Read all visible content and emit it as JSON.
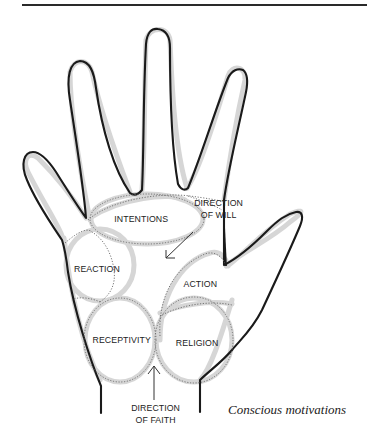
{
  "figure": {
    "title": "Conscious motivations",
    "caption": "Conscious motivations",
    "zones": [
      {
        "id": "intentions",
        "label": "INTENTIONS"
      },
      {
        "id": "reaction",
        "label": "REACTION"
      },
      {
        "id": "action",
        "label": "ACTION"
      },
      {
        "id": "receptivity",
        "label": "RECEPTIVITY"
      },
      {
        "id": "religion",
        "label": "RELIGION"
      }
    ],
    "directions": [
      {
        "id": "will",
        "line1": "DIRECTION",
        "line2": "OF WILL",
        "arrow": "down-left-arrow"
      },
      {
        "id": "faith",
        "line1": "DIRECTION",
        "line2": "OF FAITH",
        "arrow": "up-arrow"
      }
    ]
  },
  "colors": {
    "ink": "#1a1a1a",
    "stipple": "#9a9a9a",
    "background": "#ffffff"
  }
}
